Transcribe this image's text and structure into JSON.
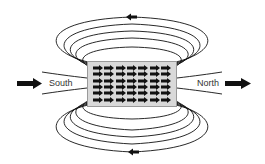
{
  "diagram": {
    "labels": {
      "south": "South",
      "north": "North"
    },
    "magnet": {
      "rows": 6,
      "columns": 7,
      "domain_arrow_direction": "right",
      "fill_color": "#d9d9d9"
    },
    "field_lines": {
      "loops_above": 5,
      "loops_below": 5,
      "open_lines_left": 2,
      "open_lines_right": 2,
      "direction_arrow_top": "left",
      "direction_arrow_bottom": "left",
      "stroke_color": "#111111"
    },
    "external_arrows": [
      {
        "side": "left",
        "direction": "right"
      },
      {
        "side": "right",
        "direction": "right"
      }
    ]
  }
}
